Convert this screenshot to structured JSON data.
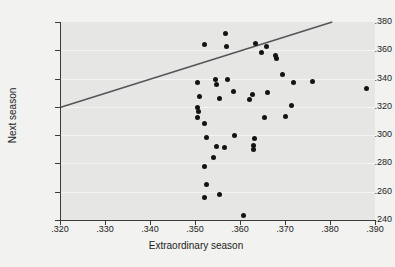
{
  "chart_data": {
    "type": "scatter",
    "title": "",
    "xlabel": "Extraordinary season",
    "ylabel": "Next season",
    "xlim": [
      0.32,
      0.39
    ],
    "ylim": [
      0.24,
      0.38
    ],
    "xticks": [
      0.32,
      0.33,
      0.34,
      0.35,
      0.36,
      0.37,
      0.38,
      0.39
    ],
    "yticks": [
      0.24,
      0.26,
      0.28,
      0.3,
      0.32,
      0.34,
      0.36,
      0.38
    ],
    "xticklabels": [
      ".320",
      ".330",
      ".340",
      ".350",
      ".360",
      ".370",
      ".380",
      ".390"
    ],
    "yticklabels": [
      ".240",
      ".260",
      ".280",
      ".300",
      ".320",
      ".340",
      ".360",
      ".380"
    ],
    "grid": "horizontal",
    "legend": "none",
    "panel_color": "#e6e6e4",
    "point_color": "#141414",
    "line_color": "#55555a",
    "points": [
      {
        "x": 0.3505,
        "y": 0.337
      },
      {
        "x": 0.352,
        "y": 0.364
      },
      {
        "x": 0.351,
        "y": 0.3275
      },
      {
        "x": 0.3505,
        "y": 0.3195
      },
      {
        "x": 0.3508,
        "y": 0.3165
      },
      {
        "x": 0.3505,
        "y": 0.3125
      },
      {
        "x": 0.352,
        "y": 0.3082
      },
      {
        "x": 0.3525,
        "y": 0.2985
      },
      {
        "x": 0.352,
        "y": 0.278
      },
      {
        "x": 0.3525,
        "y": 0.2648
      },
      {
        "x": 0.3522,
        "y": 0.256
      },
      {
        "x": 0.3545,
        "y": 0.339
      },
      {
        "x": 0.3548,
        "y": 0.3355
      },
      {
        "x": 0.3555,
        "y": 0.326
      },
      {
        "x": 0.3548,
        "y": 0.292
      },
      {
        "x": 0.3542,
        "y": 0.284
      },
      {
        "x": 0.3555,
        "y": 0.258
      },
      {
        "x": 0.3568,
        "y": 0.372
      },
      {
        "x": 0.357,
        "y": 0.3625
      },
      {
        "x": 0.3572,
        "y": 0.339
      },
      {
        "x": 0.3565,
        "y": 0.291
      },
      {
        "x": 0.3585,
        "y": 0.331
      },
      {
        "x": 0.3588,
        "y": 0.3
      },
      {
        "x": 0.3608,
        "y": 0.243
      },
      {
        "x": 0.3622,
        "y": 0.325
      },
      {
        "x": 0.3628,
        "y": 0.3285
      },
      {
        "x": 0.3632,
        "y": 0.2975
      },
      {
        "x": 0.363,
        "y": 0.293
      },
      {
        "x": 0.363,
        "y": 0.2898
      },
      {
        "x": 0.3635,
        "y": 0.365
      },
      {
        "x": 0.3648,
        "y": 0.3585
      },
      {
        "x": 0.3658,
        "y": 0.3625
      },
      {
        "x": 0.3662,
        "y": 0.33
      },
      {
        "x": 0.3655,
        "y": 0.3125
      },
      {
        "x": 0.3678,
        "y": 0.3565
      },
      {
        "x": 0.368,
        "y": 0.354
      },
      {
        "x": 0.3695,
        "y": 0.343
      },
      {
        "x": 0.37,
        "y": 0.3132
      },
      {
        "x": 0.3718,
        "y": 0.337
      },
      {
        "x": 0.3715,
        "y": 0.3212
      },
      {
        "x": 0.376,
        "y": 0.338
      },
      {
        "x": 0.388,
        "y": 0.333
      }
    ],
    "fit_line": {
      "x1": 0.32,
      "y1": 0.3195,
      "x2": 0.3805,
      "y2": 0.38
    }
  }
}
